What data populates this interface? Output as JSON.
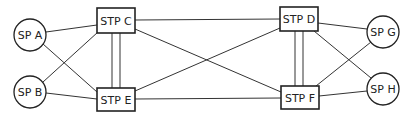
{
  "diagram": {
    "title": "",
    "type": "network-topology",
    "colors": {
      "stroke": "#222222",
      "background": "#ffffff"
    },
    "nodes": [
      {
        "id": "SPA",
        "label": "SP A",
        "shape": "circle",
        "cx": 30,
        "cy": 35,
        "r": 16
      },
      {
        "id": "SPB",
        "label": "SP B",
        "shape": "circle",
        "cx": 30,
        "cy": 92,
        "r": 16
      },
      {
        "id": "STPC",
        "label": "STP C",
        "shape": "rect",
        "x": 97,
        "y": 8,
        "w": 38,
        "h": 25
      },
      {
        "id": "STPE",
        "label": "STP E",
        "shape": "rect",
        "x": 97,
        "y": 88,
        "w": 38,
        "h": 23
      },
      {
        "id": "STPD",
        "label": "STP D",
        "shape": "rect",
        "x": 280,
        "y": 7,
        "w": 38,
        "h": 24
      },
      {
        "id": "STPF",
        "label": "STP F",
        "shape": "rect",
        "x": 281,
        "y": 86,
        "w": 38,
        "h": 23
      },
      {
        "id": "SPG",
        "label": "SP G",
        "shape": "circle",
        "cx": 383,
        "cy": 32,
        "r": 16
      },
      {
        "id": "SPH",
        "label": "SP H",
        "shape": "circle",
        "cx": 383,
        "cy": 89,
        "r": 16
      }
    ],
    "links": [
      {
        "from": "SPA",
        "to": "STPC",
        "x1": 46,
        "y1": 32,
        "x2": 97,
        "y2": 25
      },
      {
        "from": "SPA",
        "to": "STPE",
        "x1": 43,
        "y1": 44,
        "x2": 97,
        "y2": 92
      },
      {
        "from": "SPB",
        "to": "STPC",
        "x1": 43,
        "y1": 82,
        "x2": 98,
        "y2": 32
      },
      {
        "from": "SPB",
        "to": "STPE",
        "x1": 46,
        "y1": 93,
        "x2": 97,
        "y2": 99
      },
      {
        "from": "STPC",
        "to": "STPE",
        "x1": 112,
        "y1": 33,
        "x2": 112,
        "y2": 88
      },
      {
        "from": "STPC",
        "to": "STPE",
        "x1": 120,
        "y1": 33,
        "x2": 120,
        "y2": 88
      },
      {
        "from": "STPC",
        "to": "STPD",
        "x1": 135,
        "y1": 20,
        "x2": 280,
        "y2": 19
      },
      {
        "from": "STPC",
        "to": "STPF",
        "x1": 135,
        "y1": 29,
        "x2": 281,
        "y2": 92
      },
      {
        "from": "STPE",
        "to": "STPD",
        "x1": 135,
        "y1": 91,
        "x2": 280,
        "y2": 28
      },
      {
        "from": "STPE",
        "to": "STPF",
        "x1": 135,
        "y1": 99,
        "x2": 281,
        "y2": 98
      },
      {
        "from": "STPD",
        "to": "STPF",
        "x1": 295,
        "y1": 31,
        "x2": 295,
        "y2": 86
      },
      {
        "from": "STPD",
        "to": "STPF",
        "x1": 303,
        "y1": 31,
        "x2": 303,
        "y2": 86
      },
      {
        "from": "STPD",
        "to": "SPG",
        "x1": 318,
        "y1": 23,
        "x2": 367,
        "y2": 29
      },
      {
        "from": "STPD",
        "to": "SPH",
        "x1": 314,
        "y1": 31,
        "x2": 371,
        "y2": 78
      },
      {
        "from": "STPF",
        "to": "SPG",
        "x1": 316,
        "y1": 86,
        "x2": 371,
        "y2": 42
      },
      {
        "from": "STPF",
        "to": "SPH",
        "x1": 319,
        "y1": 96,
        "x2": 367,
        "y2": 91
      }
    ]
  }
}
